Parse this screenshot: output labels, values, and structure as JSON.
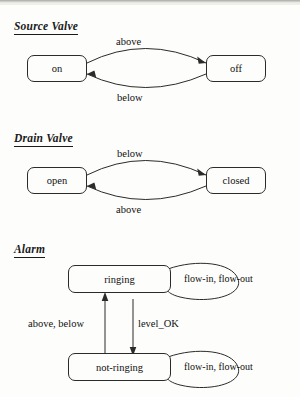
{
  "document": {
    "title": "State transition diagrams",
    "background_color": "#fdfdfb",
    "ink_color": "#2b2b2b"
  },
  "sections": [
    {
      "id": "source-valve",
      "heading": "Source Valve",
      "type": "two-state-bidirectional",
      "states": [
        {
          "id": "on",
          "label": "on"
        },
        {
          "id": "off",
          "label": "off"
        }
      ],
      "transitions": [
        {
          "from": "on",
          "to": "off",
          "label": "above",
          "position": "top"
        },
        {
          "from": "off",
          "to": "on",
          "label": "below",
          "position": "bottom"
        }
      ]
    },
    {
      "id": "drain-valve",
      "heading": "Drain  Valve",
      "type": "two-state-bidirectional",
      "states": [
        {
          "id": "open",
          "label": "open"
        },
        {
          "id": "closed",
          "label": "closed"
        }
      ],
      "transitions": [
        {
          "from": "open",
          "to": "closed",
          "label": "below",
          "position": "top"
        },
        {
          "from": "closed",
          "to": "open",
          "label": "above",
          "position": "bottom"
        }
      ]
    },
    {
      "id": "alarm",
      "heading": "Alarm",
      "type": "two-state-vertical-with-selfloops",
      "states": [
        {
          "id": "ringing",
          "label": "ringing"
        },
        {
          "id": "not-ringing",
          "label": "not-ringing"
        }
      ],
      "transitions": [
        {
          "from": "not-ringing",
          "to": "ringing",
          "label": "above, below",
          "position": "left"
        },
        {
          "from": "ringing",
          "to": "not-ringing",
          "label": "level_OK",
          "position": "right"
        }
      ],
      "self_loops": [
        {
          "state": "ringing",
          "label": "flow-in, flow-out"
        },
        {
          "state": "not-ringing",
          "label": "flow-in, flow-out"
        }
      ]
    }
  ]
}
